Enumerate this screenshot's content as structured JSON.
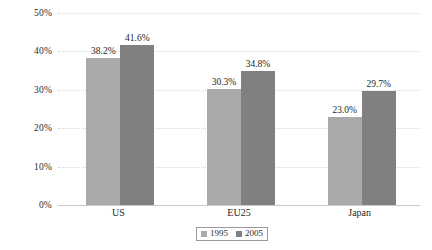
{
  "chart_data": {
    "type": "bar",
    "title": "",
    "subtitle": "",
    "xlabel": "",
    "ylabel": "",
    "categories": [
      "US",
      "EU25",
      "Japan"
    ],
    "series": [
      {
        "name": "1995",
        "color": "#aaaaaa",
        "values": [
          38.2,
          30.3,
          23.0
        ],
        "labels": [
          "38.2%",
          "30.3%",
          "23.0%"
        ]
      },
      {
        "name": "2005",
        "color": "#808080",
        "values": [
          41.6,
          34.8,
          29.7
        ],
        "labels": [
          "41.6%",
          "34.8%",
          "29.7%"
        ]
      }
    ],
    "ylim": [
      0,
      50
    ],
    "yticks": [
      0,
      10,
      20,
      30,
      40,
      50
    ],
    "ytick_labels": [
      "0%",
      "10%",
      "20%",
      "30%",
      "40%",
      "50%"
    ],
    "grid": true,
    "grid_axis": "y",
    "legend_position": "bottom-center",
    "value_labels_shown": true
  },
  "legend": {
    "items": [
      {
        "label": "1995",
        "color": "#aaaaaa"
      },
      {
        "label": "2005",
        "color": "#808080"
      }
    ]
  }
}
